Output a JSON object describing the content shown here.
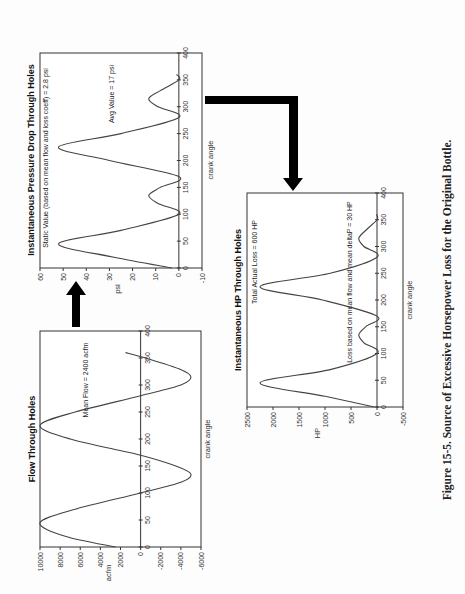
{
  "figure": {
    "caption": "Figure 15-5. Source of Excessive Horsepower Loss for the Original Bottle.",
    "orientation": "rotated 90° counter-clockwise"
  },
  "charts": {
    "flow": {
      "title": "Flow Through Holes",
      "xlabel": "crank angle",
      "ylabel": "acfm",
      "annotation": "Mean Flow = 2400 acfm"
    },
    "pressure": {
      "title": "Instantaneous Pressure Drop Through Holes",
      "xlabel": "crank angle",
      "ylabel": "psi",
      "annotation_static": "Static Value (based on mean flow and loss coeff) = 2.8 psi",
      "annotation_avg": "Avg Value = 17 psi"
    },
    "hp": {
      "title": "Instantaneous HP Through Holes",
      "xlabel": "crank angle",
      "ylabel": "HP",
      "annotation_total": "Total Actual Loss = 600 HP",
      "annotation_mean": "Loss based on mean flow and mean deltaP = 30 HP"
    }
  },
  "chart_data": [
    {
      "type": "line",
      "title": "Flow Through Holes",
      "xlabel": "crank angle",
      "ylabel": "acfm",
      "xlim": [
        0,
        400
      ],
      "ylim": [
        -6000,
        10000
      ],
      "xticks": [
        0,
        50,
        100,
        150,
        200,
        250,
        300,
        350,
        400
      ],
      "yticks": [
        -6000,
        -4000,
        -2000,
        0,
        2000,
        4000,
        6000,
        8000,
        10000
      ],
      "grid": false,
      "annotations": [
        "Mean Flow = 2400 acfm"
      ],
      "series": [
        {
          "name": "flow",
          "x": [
            0,
            20,
            45,
            70,
            100,
            120,
            135,
            150,
            170,
            200,
            225,
            250,
            280,
            300,
            315,
            330,
            350,
            360
          ],
          "y": [
            2500,
            7500,
            10000,
            6500,
            0,
            -4000,
            -5000,
            -3500,
            0,
            7000,
            10000,
            6500,
            0,
            -4000,
            -5000,
            -3800,
            -500,
            1500
          ]
        }
      ]
    },
    {
      "type": "line",
      "title": "Instantaneous Pressure Drop Through Holes",
      "xlabel": "crank angle",
      "ylabel": "psi",
      "xlim": [
        0,
        400
      ],
      "ylim": [
        -10,
        60
      ],
      "xticks": [
        0,
        50,
        100,
        150,
        200,
        250,
        300,
        350,
        400
      ],
      "yticks": [
        -10,
        0,
        10,
        20,
        30,
        40,
        50,
        60
      ],
      "grid": false,
      "annotations": [
        "Static Value (based on mean flow and loss coeff) = 2.8 psi",
        "Avg Value = 17 psi"
      ],
      "series": [
        {
          "name": "pressure drop",
          "x": [
            0,
            20,
            45,
            70,
            100,
            120,
            135,
            150,
            170,
            200,
            225,
            250,
            280,
            300,
            315,
            330,
            350,
            360
          ],
          "y": [
            3,
            28,
            52,
            25,
            0,
            9,
            13,
            8,
            0,
            30,
            52,
            25,
            0,
            9,
            13,
            8,
            0,
            1
          ]
        }
      ]
    },
    {
      "type": "line",
      "title": "Instantaneous HP Through Holes",
      "xlabel": "crank angle",
      "ylabel": "HP",
      "xlim": [
        0,
        400
      ],
      "ylim": [
        -500,
        2500
      ],
      "xticks": [
        0,
        50,
        100,
        150,
        200,
        250,
        300,
        350,
        400
      ],
      "yticks": [
        -500,
        0,
        500,
        1000,
        1500,
        2000,
        2500
      ],
      "grid": false,
      "annotations": [
        "Total Actual Loss = 600 HP",
        "Loss based on mean flow and mean deltaP = 30 HP"
      ],
      "series": [
        {
          "name": "HP",
          "x": [
            0,
            20,
            45,
            70,
            100,
            120,
            135,
            150,
            170,
            200,
            225,
            250,
            280,
            300,
            315,
            330,
            350,
            360
          ],
          "y": [
            50,
            1000,
            2250,
            900,
            0,
            250,
            350,
            220,
            0,
            1050,
            2250,
            900,
            0,
            250,
            350,
            220,
            0,
            10
          ]
        }
      ]
    }
  ]
}
